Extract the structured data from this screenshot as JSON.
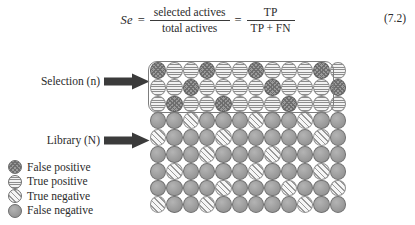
{
  "equation": {
    "lhs": "Se",
    "equals_1": "=",
    "fraction_1": {
      "numerator": "selected actives",
      "denominator": "total actives"
    },
    "equals_2": "=",
    "fraction_2": {
      "numerator": "TP",
      "denominator": "TP + FN"
    },
    "number": "(7.2)"
  },
  "diagram": {
    "selection_label": "Selection (n)",
    "library_label": "Library (N)",
    "selection_arrow_icon": "right-arrow-icon",
    "library_arrow_icon": "right-arrow-icon"
  },
  "legend": {
    "items": [
      {
        "label": "False positive",
        "pattern": "p-fp",
        "swatch_icon": "crosshatch-circle-icon"
      },
      {
        "label": "True positive",
        "pattern": "p-tp",
        "swatch_icon": "horizontal-stripe-circle-icon"
      },
      {
        "label": "True negative",
        "pattern": "p-tn",
        "swatch_icon": "diagonal-stripe-circle-icon"
      },
      {
        "label": "False negative",
        "pattern": "p-fn",
        "swatch_icon": "solid-gray-circle-icon"
      }
    ]
  },
  "grid": {
    "columns": 12,
    "selection_rows": 3,
    "library_rows": 6,
    "cells": [
      [
        "p-fp",
        "p-tp",
        "p-tp",
        "p-fp",
        "p-tp",
        "p-tp",
        "p-fp",
        "p-tp",
        "p-tp",
        "p-tp",
        "p-fp",
        "p-tp"
      ],
      [
        "p-tp",
        "p-tp",
        "p-fp",
        "p-tp",
        "p-tp",
        "p-tp",
        "p-tp",
        "p-fp",
        "p-tp",
        "p-tp",
        "p-tp",
        "p-fp"
      ],
      [
        "p-tp",
        "p-fp",
        "p-tp",
        "p-tp",
        "p-fp",
        "p-tp",
        "p-tp",
        "p-tp",
        "p-fp",
        "p-tp",
        "p-tp",
        "p-tp"
      ],
      [
        "p-fn",
        "p-fn",
        "p-tn",
        "p-fn",
        "p-fn",
        "p-fn",
        "p-tn",
        "p-fn",
        "p-fn",
        "p-tn",
        "p-fn",
        "p-fn"
      ],
      [
        "p-tn",
        "p-fn",
        "p-fn",
        "p-fn",
        "p-tn",
        "p-fn",
        "p-fn",
        "p-fn",
        "p-fn",
        "p-fn",
        "p-tn",
        "p-fn"
      ],
      [
        "p-fn",
        "p-fn",
        "p-fn",
        "p-tn",
        "p-fn",
        "p-fn",
        "p-fn",
        "p-tn",
        "p-fn",
        "p-fn",
        "p-fn",
        "p-fn"
      ],
      [
        "p-fn",
        "p-tn",
        "p-fn",
        "p-fn",
        "p-fn",
        "p-fn",
        "p-tn",
        "p-fn",
        "p-fn",
        "p-fn",
        "p-tn",
        "p-fn"
      ],
      [
        "p-fn",
        "p-fn",
        "p-fn",
        "p-fn",
        "p-tn",
        "p-fn",
        "p-fn",
        "p-fn",
        "p-tn",
        "p-fn",
        "p-fn",
        "p-tn"
      ],
      [
        "p-tn",
        "p-fn",
        "p-fn",
        "p-tn",
        "p-fn",
        "p-fn",
        "p-fn",
        "p-fn",
        "p-fn",
        "p-tn",
        "p-fn",
        "p-fn"
      ]
    ]
  }
}
